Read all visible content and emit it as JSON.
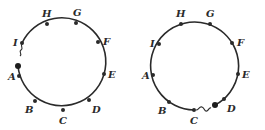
{
  "diagrams": [
    {
      "id": "left",
      "description": "Ring of nodes broken between I and A",
      "nodes": [
        {
          "label": "H",
          "x": 47,
          "y": 24,
          "lx": 42,
          "ly": 17
        },
        {
          "label": "G",
          "x": 76,
          "y": 23,
          "lx": 73,
          "ly": 16
        },
        {
          "label": "F",
          "x": 98,
          "y": 42,
          "lx": 103,
          "ly": 44
        },
        {
          "label": "E",
          "x": 104,
          "y": 74,
          "lx": 109,
          "ly": 78
        },
        {
          "label": "D",
          "x": 89,
          "y": 100,
          "lx": 92,
          "ly": 112
        },
        {
          "label": "C",
          "x": 63,
          "y": 110,
          "lx": 59,
          "ly": 124
        },
        {
          "label": "B",
          "x": 35,
          "y": 101,
          "lx": 24,
          "ly": 112
        },
        {
          "label": "A",
          "x": 19,
          "y": 76,
          "lx": 8,
          "ly": 80
        },
        {
          "label": "I",
          "x": 22,
          "y": 43,
          "lx": 13,
          "ly": 45
        }
      ],
      "break": {
        "between": [
          "I",
          "A"
        ],
        "big_dot": {
          "x": 18,
          "y": 66
        },
        "wiggle_at": {
          "x": 20,
          "y": 52
        }
      }
    },
    {
      "id": "right",
      "description": "Ring of nodes broken between C and D",
      "nodes": [
        {
          "label": "H",
          "x": 181,
          "y": 24,
          "lx": 176,
          "ly": 17
        },
        {
          "label": "G",
          "x": 210,
          "y": 24,
          "lx": 206,
          "ly": 17
        },
        {
          "label": "F",
          "x": 232,
          "y": 43,
          "lx": 237,
          "ly": 46
        },
        {
          "label": "E",
          "x": 238,
          "y": 74,
          "lx": 243,
          "ly": 78
        },
        {
          "label": "D",
          "x": 224,
          "y": 99,
          "lx": 227,
          "ly": 111
        },
        {
          "label": "C",
          "x": 194,
          "y": 110,
          "lx": 190,
          "ly": 124
        },
        {
          "label": "B",
          "x": 169,
          "y": 102,
          "lx": 158,
          "ly": 113
        },
        {
          "label": "A",
          "x": 153,
          "y": 75,
          "lx": 142,
          "ly": 79
        },
        {
          "label": "I",
          "x": 159,
          "y": 44,
          "lx": 150,
          "ly": 46
        }
      ],
      "break": {
        "between": [
          "C",
          "D"
        ],
        "big_dot": {
          "x": 215,
          "y": 105
        },
        "wiggle_at": {
          "x": 203,
          "y": 108
        }
      }
    }
  ],
  "labels": {
    "left": [
      "H",
      "G",
      "F",
      "E",
      "D",
      "C",
      "B",
      "A",
      "I"
    ],
    "right": [
      "H",
      "G",
      "F",
      "E",
      "D",
      "C",
      "B",
      "A",
      "I"
    ]
  }
}
